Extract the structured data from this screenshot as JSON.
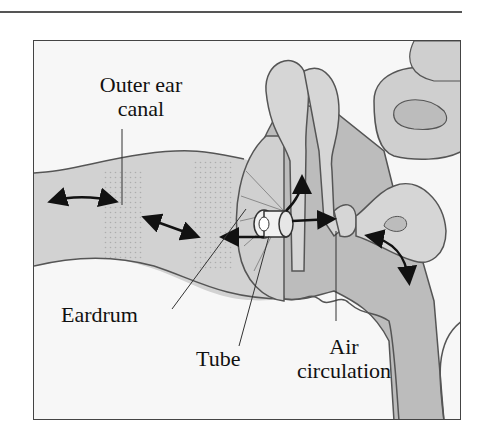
{
  "figure": {
    "labels": {
      "outer_ear_canal_line1": "Outer ear",
      "outer_ear_canal_line2": "canal",
      "eardrum": "Eardrum",
      "tube": "Tube",
      "air_circulation_line1": "Air",
      "air_circulation_line2": "circulation"
    },
    "colors": {
      "tissue_fill": "#c8c8c8",
      "tissue_dark": "#b4b4b4",
      "outline": "#555555",
      "arrow": "#111111",
      "background": "#f7f7f7"
    }
  }
}
